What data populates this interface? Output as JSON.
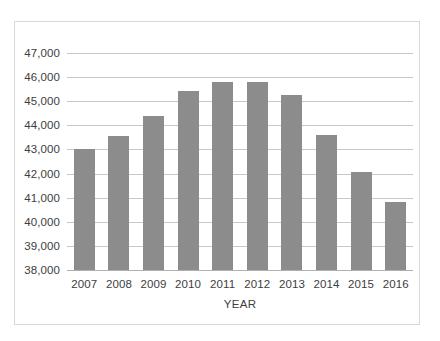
{
  "chart_data": {
    "type": "bar",
    "title": "",
    "xlabel": "YEAR",
    "ylabel": "",
    "categories": [
      "2007",
      "2008",
      "2009",
      "2010",
      "2011",
      "2012",
      "2013",
      "2014",
      "2015",
      "2016"
    ],
    "values": [
      43000,
      43560,
      44400,
      45430,
      45800,
      45800,
      45270,
      43580,
      42060,
      40820
    ],
    "ylim": [
      38000,
      47000
    ],
    "ytick_values": [
      47000,
      46000,
      45000,
      44000,
      43000,
      42000,
      41000,
      40000,
      39000,
      38000
    ],
    "ytick_labels": [
      "47,000",
      "46,000",
      "45,000",
      "44,000",
      "43,000",
      "42,000",
      "41,000",
      "40,000",
      "39,000",
      "38,000"
    ],
    "grid": true,
    "legend": "none",
    "series_name": "",
    "bar_color": "#8c8c8c",
    "gridline_color": "#c8c8c8",
    "border_color": "#d9d9d9",
    "text_color": "#3d3d3d",
    "background_color": "#ffffff"
  }
}
